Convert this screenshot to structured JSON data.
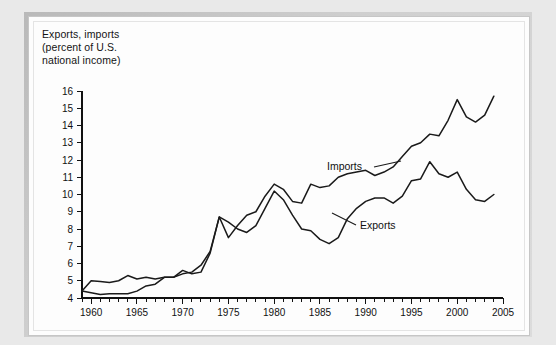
{
  "title": {
    "line1": "Exports, imports",
    "line2": "(percent of U.S.",
    "line3": "national income)"
  },
  "annotations": {
    "imports_label": "Imports",
    "exports_label": "Exports"
  },
  "colors": {
    "line": "#1a1a1a",
    "axis": "#111111",
    "page": "#fdfdfd",
    "backdrop": "#e9e9e9"
  },
  "chart_data": {
    "type": "line",
    "title": "Exports, imports (percent of U.S. national income)",
    "xlabel": "",
    "ylabel": "Exports, imports (percent of U.S. national income)",
    "xlim": [
      1959,
      2005
    ],
    "ylim": [
      4,
      16
    ],
    "grid": false,
    "legend": "inline-annotations",
    "ytick_labels": [
      "4",
      "5",
      "6",
      "7",
      "8",
      "9",
      "10",
      "11",
      "12",
      "13",
      "14",
      "15",
      "16"
    ],
    "yticks": [
      4,
      5,
      6,
      7,
      8,
      9,
      10,
      11,
      12,
      13,
      14,
      15,
      16
    ],
    "xtick_labels": [
      "1960",
      "1965",
      "1970",
      "1975",
      "1980",
      "1985",
      "1990",
      "1995",
      "2000",
      "2005"
    ],
    "xticks_major": [
      1960,
      1965,
      1970,
      1975,
      1980,
      1985,
      1990,
      1995,
      2000,
      2005
    ],
    "xtick_minor_step": 1,
    "x": [
      1959,
      1960,
      1961,
      1962,
      1963,
      1964,
      1965,
      1966,
      1967,
      1968,
      1969,
      1970,
      1971,
      1972,
      1973,
      1974,
      1975,
      1976,
      1977,
      1978,
      1979,
      1980,
      1981,
      1982,
      1983,
      1984,
      1985,
      1986,
      1987,
      1988,
      1989,
      1990,
      1991,
      1992,
      1993,
      1994,
      1995,
      1996,
      1997,
      1998,
      1999,
      2000,
      2001,
      2002,
      2003,
      2004
    ],
    "series": [
      {
        "name": "Imports",
        "values": [
          4.4,
          4.3,
          4.2,
          4.25,
          4.25,
          4.25,
          4.4,
          4.7,
          4.8,
          5.2,
          5.2,
          5.4,
          5.5,
          5.9,
          6.7,
          8.7,
          7.5,
          8.2,
          8.8,
          9.0,
          9.9,
          10.6,
          10.3,
          9.6,
          9.5,
          10.6,
          10.4,
          10.5,
          11.0,
          11.2,
          11.3,
          11.4,
          11.1,
          11.3,
          11.6,
          12.2,
          12.8,
          13.0,
          13.5,
          13.4,
          14.3,
          15.5,
          14.5,
          14.2,
          14.6,
          15.7
        ]
      },
      {
        "name": "Exports",
        "values": [
          4.4,
          5.0,
          4.95,
          4.9,
          5.0,
          5.3,
          5.1,
          5.2,
          5.1,
          5.2,
          5.2,
          5.6,
          5.4,
          5.5,
          6.6,
          8.7,
          8.4,
          8.0,
          7.8,
          8.2,
          9.2,
          10.2,
          9.7,
          8.8,
          8.0,
          7.9,
          7.4,
          7.15,
          7.5,
          8.6,
          9.2,
          9.6,
          9.8,
          9.8,
          9.5,
          9.9,
          10.8,
          10.9,
          11.9,
          11.2,
          11.0,
          11.3,
          10.3,
          9.7,
          9.6,
          10.0
        ]
      }
    ],
    "annotations": [
      {
        "text": "Imports",
        "anchor_x": 1989,
        "anchor_y": 12.0
      },
      {
        "text": "Exports",
        "anchor_x": 1990,
        "anchor_y": 8.8
      }
    ]
  }
}
